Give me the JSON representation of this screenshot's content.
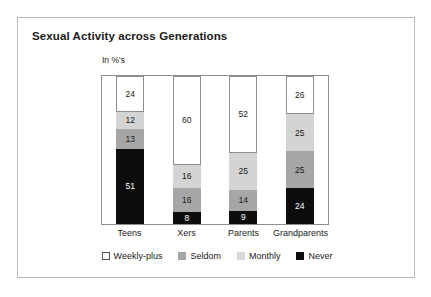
{
  "chart_data": {
    "type": "bar",
    "subtype": "stacked-100-percent",
    "title": "Sexual Activity across Generations",
    "axis_unit_note": "In %'s",
    "xlabel": "",
    "ylabel": "",
    "ylim": [
      0,
      100
    ],
    "grid": false,
    "legend_position": "bottom",
    "categories": [
      "Teens",
      "Xers",
      "Parents",
      "Grandparents"
    ],
    "series": [
      {
        "name": "Weekly-plus",
        "color": "#ffffff",
        "values": [
          24,
          60,
          52,
          26
        ]
      },
      {
        "name": "Monthly",
        "color": "#d4d4d4",
        "values": [
          12,
          16,
          25,
          25
        ]
      },
      {
        "name": "Seldom",
        "color": "#a6a6a6",
        "values": [
          13,
          16,
          14,
          25
        ]
      },
      {
        "name": "Never",
        "color": "#0d0d0d",
        "values": [
          51,
          8,
          9,
          24
        ]
      }
    ],
    "legend_order": [
      "Weekly-plus",
      "Seldom",
      "Monthly",
      "Never"
    ],
    "columns": [
      {
        "category": "Teens",
        "segments": [
          {
            "label": "Weekly-plus",
            "value": 24,
            "text": "24"
          },
          {
            "label": "Monthly",
            "value": 12,
            "text": "12"
          },
          {
            "label": "Seldom",
            "value": 13,
            "text": "13"
          },
          {
            "label": "Never",
            "value": 51,
            "text": "51"
          }
        ]
      },
      {
        "category": "Xers",
        "segments": [
          {
            "label": "Weekly-plus",
            "value": 60,
            "text": "60"
          },
          {
            "label": "Monthly",
            "value": 16,
            "text": "16"
          },
          {
            "label": "Seldom",
            "value": 16,
            "text": "16"
          },
          {
            "label": "Never",
            "value": 8,
            "text": "8"
          }
        ]
      },
      {
        "category": "Parents",
        "segments": [
          {
            "label": "Weekly-plus",
            "value": 52,
            "text": "52"
          },
          {
            "label": "Monthly",
            "value": 25,
            "text": "25"
          },
          {
            "label": "Seldom",
            "value": 14,
            "text": "14"
          },
          {
            "label": "Never",
            "value": 9,
            "text": "9"
          }
        ]
      },
      {
        "category": "Grandparents",
        "segments": [
          {
            "label": "Weekly-plus",
            "value": 26,
            "text": "26"
          },
          {
            "label": "Monthly",
            "value": 25,
            "text": "25"
          },
          {
            "label": "Seldom",
            "value": 25,
            "text": "25"
          },
          {
            "label": "Never",
            "value": 24,
            "text": "24"
          }
        ]
      }
    ]
  },
  "legend": {
    "items": [
      {
        "label": "Weekly-plus",
        "swatch": "weekly",
        "color": "#ffffff"
      },
      {
        "label": "Seldom",
        "swatch": "seldom",
        "color": "#a6a6a6"
      },
      {
        "label": "Monthly",
        "swatch": "monthly",
        "color": "#d8d8d8"
      },
      {
        "label": "Never",
        "swatch": "never",
        "color": "#0d0d0d"
      }
    ]
  },
  "colors": {
    "card_border": "#b9b9b9",
    "plot_border": "#8d8d8d",
    "text": "#1a1a1a",
    "background": "#ffffff"
  }
}
